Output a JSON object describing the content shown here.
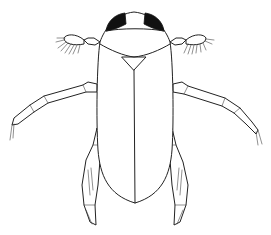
{
  "image": {
    "subject": "beetle line drawing",
    "view": "dorsal",
    "style": "black ink illustration on white",
    "colors": {
      "background": "#ffffff",
      "ink": "#222222",
      "eyes": "#111111"
    }
  }
}
